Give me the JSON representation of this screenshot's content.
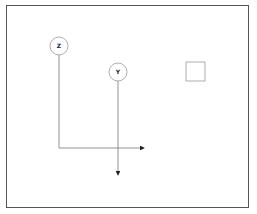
{
  "diagram": {
    "nodes": [
      {
        "id": "z",
        "label": "Z",
        "shape": "circle",
        "cx": 59,
        "cy": 46,
        "r": 9
      },
      {
        "id": "y",
        "label": "Y",
        "shape": "circle",
        "cx": 118,
        "cy": 72,
        "r": 9
      },
      {
        "id": "box",
        "label": "",
        "shape": "square",
        "x": 186,
        "y": 62,
        "w": 19,
        "h": 19
      }
    ],
    "edges": [
      {
        "from": "z",
        "path": "down then right",
        "arrow_end": [
          146,
          148
        ]
      },
      {
        "from": "y",
        "path": "down",
        "arrow_end": [
          118,
          177
        ]
      }
    ],
    "colors": {
      "stroke": "#777777",
      "border": "#555555",
      "text": "#222222"
    }
  }
}
